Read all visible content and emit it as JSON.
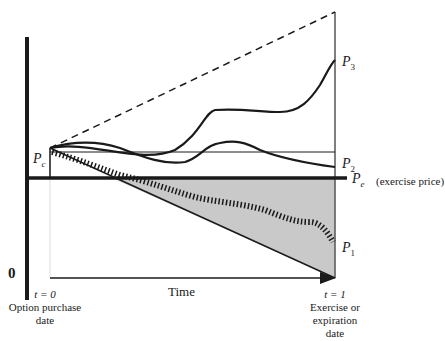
{
  "diagram": {
    "labels": {
      "pc": {
        "base": "P",
        "sub": "c"
      },
      "pe": {
        "base": "P",
        "sub": "e"
      },
      "pe_note": "(exercise price)",
      "p1": {
        "base": "P",
        "sub": "1"
      },
      "p2": {
        "base": "P",
        "sub": "2"
      },
      "p3": {
        "base": "P",
        "sub": "3"
      },
      "zero": "0",
      "time": "Time",
      "t0": "t = 0",
      "t0_desc_1": "Option purchase",
      "t0_desc_2": "date",
      "t1": "t = 1",
      "t1_desc_1": "Exercise or",
      "t1_desc_2": "expiration",
      "t1_desc_3": "date"
    },
    "colors": {
      "ink": "#1a1a1a",
      "shade": "#c8c8c8"
    }
  }
}
